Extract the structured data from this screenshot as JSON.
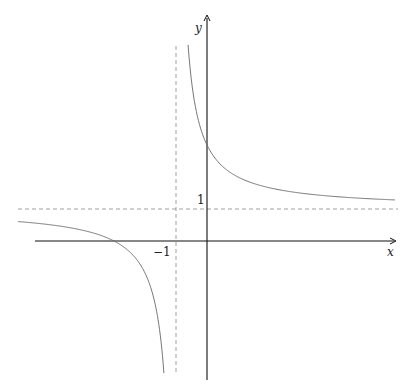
{
  "chart_data": {
    "type": "line",
    "title": "",
    "xlabel": "x",
    "ylabel": "y",
    "function": "y = 1 + 2/(x+1)",
    "tick_labels": {
      "x": [
        "-1"
      ],
      "y": [
        "1"
      ]
    },
    "asymptotes": {
      "vertical": -1,
      "horizontal": 1
    },
    "xlim": [
      -6.1,
      6.1
    ],
    "ylim": [
      -4.4,
      7.1
    ],
    "grid": false,
    "legend": null,
    "series": [
      {
        "name": "left branch",
        "x": [
          -6.1,
          -5,
          -4,
          -3,
          -2,
          -1.5,
          -1.39
        ],
        "y": [
          0.61,
          0.5,
          0.33,
          0,
          -1,
          -3,
          -4.1
        ]
      },
      {
        "name": "right branch",
        "x": [
          -0.61,
          -0.5,
          0,
          1,
          2,
          3,
          4,
          5,
          6.06
        ],
        "y": [
          6.1,
          5,
          3,
          2,
          1.67,
          1.5,
          1.4,
          1.33,
          1.28
        ]
      }
    ]
  },
  "labels": {
    "x_axis": "x",
    "y_axis": "y",
    "tick_x": "−1",
    "tick_y": "1"
  }
}
